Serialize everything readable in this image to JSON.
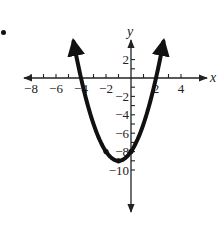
{
  "item_marker": "•",
  "chart_data": {
    "type": "line",
    "title": "",
    "function": "y = x^2 + 2x - 8",
    "xlabel": "x",
    "ylabel": "y",
    "xlim": [
      -9,
      5
    ],
    "ylim": [
      -11,
      3
    ],
    "grid": false,
    "legend": null,
    "x_ticks": [
      -8,
      -7,
      -6,
      -5,
      -4,
      -3,
      -2,
      -1,
      1,
      2,
      3,
      4
    ],
    "x_tick_labels": [
      "-8",
      "-6",
      "-4",
      "-2",
      "2",
      "4"
    ],
    "x_tick_label_values": [
      -8,
      -6,
      -4,
      -2,
      2,
      4
    ],
    "y_ticks": [
      2,
      1,
      -1,
      -2,
      -3,
      -4,
      -5,
      -6,
      -7,
      -8,
      -9,
      -10
    ],
    "y_tick_labels": [
      "2",
      "-2",
      "-4",
      "-6",
      "-8",
      "-10"
    ],
    "y_tick_label_values": [
      2,
      -2,
      -4,
      -6,
      -8,
      -10
    ],
    "series": [
      {
        "name": "parabola",
        "x": [
          -4.6,
          -4,
          -3,
          -2,
          -1,
          0,
          1,
          2,
          2.6
        ],
        "y": [
          3.96,
          0,
          -5,
          -8,
          -9,
          -8,
          -5,
          0,
          3.96
        ]
      }
    ],
    "key_points": [
      {
        "x": -4,
        "y": 0,
        "label": "x-intercept"
      },
      {
        "x": 2,
        "y": 0,
        "label": "x-intercept"
      },
      {
        "x": -1,
        "y": -9,
        "label": "vertex"
      },
      {
        "x": 0,
        "y": -8,
        "label": "y-intercept"
      },
      {
        "x": -2,
        "y": -8,
        "label": "symmetric point"
      }
    ],
    "arrows": "both ends of curve",
    "colors": {
      "curve": "#111111",
      "axes": "#222222"
    }
  }
}
